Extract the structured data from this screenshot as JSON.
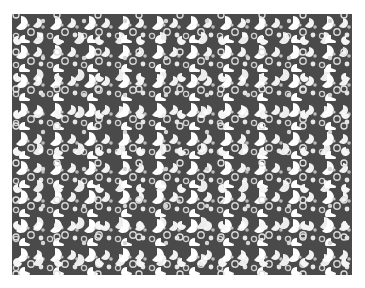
{
  "image": {
    "description": "Dense texture of white rounded blob shapes with dark wedge notches (pac-man / leaf-like) on dark gray background",
    "colors": {
      "background": "#ffffff",
      "texture_dark": "#4a4a4a",
      "blob_light": "#ffffff",
      "blob_mid": "#bdbdbd"
    }
  }
}
